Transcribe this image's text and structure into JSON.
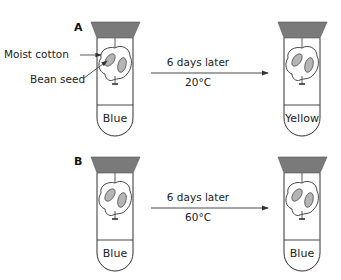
{
  "figure": {
    "panels": [
      {
        "id": "A",
        "label": "A",
        "annotations": {
          "cotton": "Moist cotton",
          "seed": "Bean seed"
        },
        "before": {
          "indicator_color_label": "Blue"
        },
        "arrow": {
          "top": "6 days later",
          "bottom": "20°C"
        },
        "after": {
          "indicator_color_label": "Yellow"
        }
      },
      {
        "id": "B",
        "label": "B",
        "before": {
          "indicator_color_label": "Blue"
        },
        "arrow": {
          "top": "6 days later",
          "bottom": "60°C"
        },
        "after": {
          "indicator_color_label": "Blue"
        }
      }
    ],
    "colors": {
      "stopper": "#7a7a7a",
      "seed": "#b5b5b5",
      "line": "#333333"
    }
  }
}
